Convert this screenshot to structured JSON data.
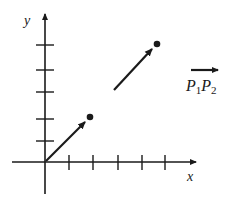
{
  "figure": {
    "type": "coordinate-plane-vector-diagram",
    "colors": {
      "ink": "#1a1a1a",
      "background": "#ffffff"
    },
    "axes": {
      "x_label": "x",
      "y_label": "y",
      "origin_px": [
        45,
        162
      ],
      "x_ticks_px": [
        69,
        93,
        118,
        142,
        165
      ],
      "y_ticks_px": [
        141,
        119,
        92,
        70,
        45
      ]
    },
    "vectors": [
      {
        "name": "position-vector",
        "from_px": [
          45,
          162
        ],
        "to_px": [
          90,
          117
        ],
        "endpoint_dot": true
      },
      {
        "name": "translated-vector",
        "from_px": [
          114,
          90
        ],
        "to_px": [
          157,
          44
        ],
        "endpoint_dot": true
      }
    ],
    "vector_label": {
      "p1": "P",
      "p1_sub": "1",
      "p2": "P",
      "p2_sub": "2",
      "has_overarrow": true
    }
  }
}
